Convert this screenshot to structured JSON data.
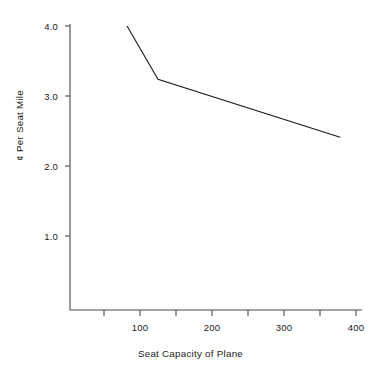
{
  "chart_data": {
    "type": "line",
    "title": "",
    "subtitle": "",
    "xlabel": "Seat Capacity of Plane",
    "ylabel": "¢ Per Seat Mile",
    "xlim": [
      50,
      400
    ],
    "ylim": [
      0.6,
      4.1
    ],
    "grid": false,
    "legend": null,
    "x_major_ticks": [
      100,
      200,
      300,
      400
    ],
    "x_major_tick_labels": [
      "100",
      "200",
      "300",
      "400"
    ],
    "x_minor_ticks": [
      50,
      150,
      250,
      350
    ],
    "y_major_ticks": [
      1.0,
      2.0,
      3.0,
      4.0
    ],
    "y_major_tick_labels": [
      "1.0",
      "2.0",
      "3.0",
      "4.0"
    ],
    "series": [
      {
        "name": "Cost per seat mile",
        "x": [
          82,
          125,
          378
        ],
        "y": [
          4.0,
          3.24,
          2.41
        ],
        "color": "#1a1a1a",
        "line_width": 1.1,
        "markers": false
      }
    ],
    "annotations": []
  },
  "axes": {
    "axis_color": "#4a4a4a",
    "line_color": "#1a1a1a",
    "background": "#ffffff"
  },
  "ticks": {
    "y": [
      {
        "label": "4.0",
        "top": 26
      },
      {
        "label": "3.0",
        "top": 96
      },
      {
        "label": "2.0",
        "top": 166
      },
      {
        "label": "1.0",
        "top": 236
      }
    ],
    "x": [
      {
        "label": "100",
        "left": 140
      },
      {
        "label": "200",
        "left": 212
      },
      {
        "label": "300",
        "left": 284
      },
      {
        "label": "400",
        "left": 356
      }
    ]
  }
}
